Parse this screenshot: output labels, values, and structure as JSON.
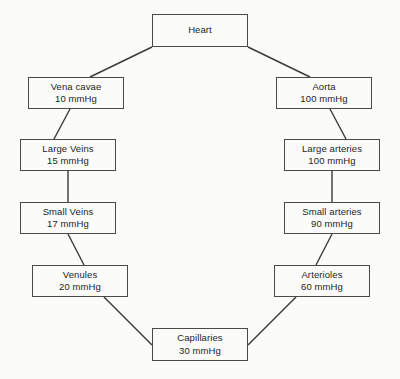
{
  "diagram": {
    "unit": "mmHg",
    "style": {
      "background": "#fbfbfa",
      "line_color": "#3a3a3a",
      "text_color": "#1d1d1d"
    },
    "nodes": [
      {
        "id": "heart",
        "label": "Heart",
        "value": "",
        "x": 152,
        "y": 14,
        "w": 96,
        "h": 33
      },
      {
        "id": "aorta",
        "label": "Aorta",
        "value": "100 mmHg",
        "x": 276,
        "y": 77,
        "w": 96,
        "h": 32
      },
      {
        "id": "large-arteries",
        "label": "Large arteries",
        "value": "100 mmHg",
        "x": 284,
        "y": 139,
        "w": 96,
        "h": 32
      },
      {
        "id": "small-arteries",
        "label": "Small arteries",
        "value": "90 mmHg",
        "x": 284,
        "y": 202,
        "w": 96,
        "h": 32
      },
      {
        "id": "arterioles",
        "label": "Arterioles",
        "value": "60 mmHg",
        "x": 274,
        "y": 265,
        "w": 96,
        "h": 32
      },
      {
        "id": "capillaries",
        "label": "Capillaries",
        "value": "30 mmHg",
        "x": 152,
        "y": 328,
        "w": 96,
        "h": 33
      },
      {
        "id": "venules",
        "label": "Venules",
        "value": "20 mmHg",
        "x": 32,
        "y": 265,
        "w": 96,
        "h": 32
      },
      {
        "id": "small-veins",
        "label": "Small Veins",
        "value": "17 mmHg",
        "x": 20,
        "y": 202,
        "w": 96,
        "h": 32
      },
      {
        "id": "large-veins",
        "label": "Large Veins",
        "value": "15 mmHg",
        "x": 20,
        "y": 139,
        "w": 96,
        "h": 32
      },
      {
        "id": "vena-cavae",
        "label": "Vena cavae",
        "value": "10 mmHg",
        "x": 28,
        "y": 77,
        "w": 96,
        "h": 32
      }
    ],
    "edges": [
      {
        "from": "heart",
        "to": "aorta",
        "x1": 248,
        "y1": 47,
        "x2": 310,
        "y2": 77
      },
      {
        "from": "aorta",
        "to": "large-arteries",
        "x1": 330,
        "y1": 109,
        "x2": 346,
        "y2": 139
      },
      {
        "from": "large-arteries",
        "to": "small-arteries",
        "x1": 332,
        "y1": 171,
        "x2": 332,
        "y2": 202
      },
      {
        "from": "small-arteries",
        "to": "arterioles",
        "x1": 332,
        "y1": 234,
        "x2": 316,
        "y2": 265
      },
      {
        "from": "arterioles",
        "to": "capillaries",
        "x1": 296,
        "y1": 297,
        "x2": 248,
        "y2": 345
      },
      {
        "from": "capillaries",
        "to": "venules",
        "x1": 152,
        "y1": 345,
        "x2": 104,
        "y2": 297
      },
      {
        "from": "venules",
        "to": "small-veins",
        "x1": 84,
        "y1": 265,
        "x2": 68,
        "y2": 234
      },
      {
        "from": "small-veins",
        "to": "large-veins",
        "x1": 68,
        "y1": 202,
        "x2": 68,
        "y2": 171
      },
      {
        "from": "large-veins",
        "to": "vena-cavae",
        "x1": 54,
        "y1": 139,
        "x2": 70,
        "y2": 109
      },
      {
        "from": "vena-cavae",
        "to": "heart",
        "x1": 90,
        "y1": 77,
        "x2": 152,
        "y2": 47
      }
    ]
  }
}
